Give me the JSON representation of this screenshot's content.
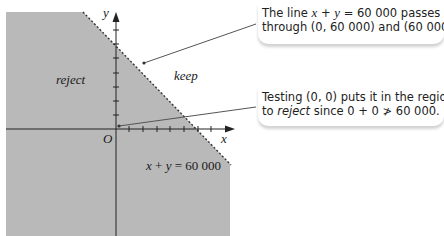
{
  "diagram": {
    "colors": {
      "shaded_region": "#b9b9b9",
      "boundary_line": "#333333",
      "axis": "#222222",
      "pointer": "#555555"
    },
    "regions": {
      "reject_label": "reject",
      "keep_label": "keep"
    },
    "axes": {
      "x_label": "x",
      "y_label": "y",
      "origin_label": "O"
    },
    "boundary": {
      "equation_lhs_x": "x",
      "equation_plus": "+",
      "equation_lhs_y": "y",
      "equation_equals": "=",
      "equation_rhs": "60 000",
      "style": "dashed"
    }
  },
  "callouts": [
    {
      "line1_prefix": "The line ",
      "line1_x": "x",
      "line1_plus": " + ",
      "line1_y": "y",
      "line1_suffix": " = 60 000 passes",
      "line2": "through (0, 60 000) and (60 000"
    },
    {
      "line1": "Testing (0, 0) puts it in the regio",
      "line2_prefix": "to ",
      "line2_em": "reject",
      "line2_suffix": " since 0 + 0 ≯ 60 000."
    }
  ]
}
